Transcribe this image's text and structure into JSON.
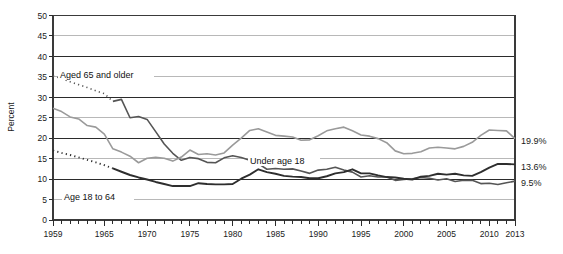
{
  "chart_data": {
    "type": "line",
    "title": "",
    "xlabel": "",
    "ylabel": "Percent",
    "ylim": [
      0,
      50
    ],
    "xlim": [
      1959,
      2013
    ],
    "y_ticks": [
      0,
      5,
      10,
      15,
      20,
      25,
      30,
      35,
      40,
      45,
      50
    ],
    "y_major_gridlines": [
      10,
      20,
      30,
      40,
      50
    ],
    "y_minor_gridlines": [
      5,
      15,
      25,
      35,
      45
    ],
    "x_ticks": [
      1959,
      1965,
      1970,
      1975,
      1980,
      1985,
      1990,
      1995,
      2000,
      2005,
      2010,
      2013
    ],
    "grid": true,
    "legend": "inline-annotations",
    "x": [
      1959,
      1960,
      1961,
      1962,
      1963,
      1964,
      1965,
      1966,
      1967,
      1968,
      1969,
      1970,
      1971,
      1972,
      1973,
      1974,
      1975,
      1976,
      1977,
      1978,
      1979,
      1980,
      1981,
      1982,
      1983,
      1984,
      1985,
      1986,
      1987,
      1988,
      1989,
      1990,
      1991,
      1992,
      1993,
      1994,
      1995,
      1996,
      1997,
      1998,
      1999,
      2000,
      2001,
      2002,
      2003,
      2004,
      2005,
      2006,
      2007,
      2008,
      2009,
      2010,
      2011,
      2012,
      2013
    ],
    "series": [
      {
        "name": "Aged 65 and older",
        "color": "#555555",
        "stroke_width": 1.6,
        "dashed_until": 1966,
        "end_value": 9.5,
        "end_label": "9.5%",
        "annotation": "Aged 65 and older",
        "values": [
          35.2,
          34.6,
          33.8,
          33.1,
          32.4,
          31.6,
          30.9,
          29.0,
          29.5,
          25.0,
          25.3,
          24.6,
          21.6,
          18.6,
          16.3,
          14.6,
          15.3,
          15.0,
          14.1,
          14.0,
          15.2,
          15.7,
          15.3,
          14.6,
          13.8,
          12.4,
          12.6,
          12.4,
          12.5,
          12.0,
          11.4,
          12.2,
          12.4,
          12.9,
          12.2,
          11.7,
          10.5,
          10.8,
          10.5,
          10.5,
          9.7,
          9.9,
          10.1,
          10.4,
          10.2,
          9.8,
          10.1,
          9.4,
          9.7,
          9.7,
          8.9,
          9.0,
          8.7,
          9.1,
          9.5
        ]
      },
      {
        "name": "Under age 18",
        "color": "#9a9a9a",
        "stroke_width": 1.6,
        "dashed_until": null,
        "end_value": 19.9,
        "end_label": "19.9%",
        "annotation": "Under age 18",
        "values": [
          27.3,
          26.5,
          25.2,
          24.7,
          23.1,
          22.7,
          21.0,
          17.4,
          16.6,
          15.6,
          14.0,
          15.1,
          15.3,
          15.1,
          14.4,
          15.4,
          17.1,
          16.0,
          16.2,
          15.9,
          16.4,
          18.3,
          20.0,
          21.9,
          22.3,
          21.5,
          20.7,
          20.5,
          20.3,
          19.5,
          19.6,
          20.6,
          21.8,
          22.3,
          22.7,
          21.8,
          20.8,
          20.5,
          19.9,
          18.9,
          16.9,
          16.2,
          16.3,
          16.7,
          17.6,
          17.8,
          17.6,
          17.4,
          18.0,
          19.0,
          20.7,
          22.0,
          21.9,
          21.8,
          19.9
        ]
      },
      {
        "name": "Age 18 to 64",
        "color": "#2e2e2e",
        "stroke_width": 1.9,
        "dashed_until": 1966,
        "end_value": 13.6,
        "end_label": "13.6%",
        "annotation": "Age 18 to 64",
        "values": [
          17.0,
          16.4,
          15.9,
          15.3,
          14.7,
          14.1,
          13.4,
          12.6,
          11.8,
          11.0,
          10.4,
          9.9,
          9.3,
          8.8,
          8.3,
          8.3,
          8.3,
          9.0,
          8.8,
          8.7,
          8.7,
          8.8,
          10.1,
          11.1,
          12.4,
          11.7,
          11.3,
          10.8,
          10.6,
          10.5,
          10.2,
          10.2,
          10.7,
          11.4,
          11.7,
          12.4,
          11.4,
          11.4,
          10.9,
          10.5,
          10.4,
          10.1,
          9.9,
          10.6,
          10.8,
          11.3,
          11.1,
          11.3,
          10.9,
          10.8,
          11.7,
          12.8,
          13.7,
          13.7,
          13.6
        ]
      }
    ]
  },
  "labels": {
    "y_axis_title": "Percent",
    "annotation_aged65": "Aged 65 and older",
    "annotation_under18": "Under age 18",
    "annotation_18to64": "Age 18 to 64",
    "endpoint_under18": "19.9%",
    "endpoint_18to64": "13.6%",
    "endpoint_aged65": "9.5%"
  }
}
